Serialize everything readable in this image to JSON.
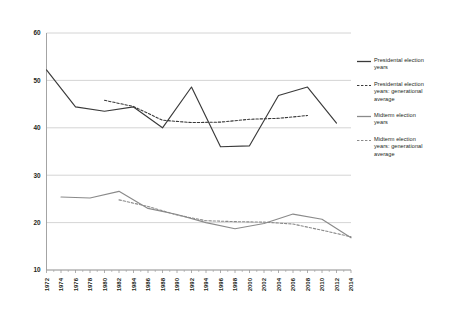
{
  "chart_data": {
    "type": "line",
    "title": "",
    "xlabel": "",
    "ylabel": "",
    "xlim": [
      1972,
      2014
    ],
    "ylim": [
      10,
      60
    ],
    "ytick_values": [
      10,
      20,
      30,
      40,
      50,
      60
    ],
    "ytick_labels": [
      "10",
      "20",
      "30",
      "40",
      "50",
      "60"
    ],
    "grid": true,
    "grid_axis": "y",
    "legend_position": "right",
    "xtick_labels": [
      "1972",
      "1974",
      "1976",
      "1978",
      "1980",
      "1982",
      "1984",
      "1986",
      "1988",
      "1990",
      "1992",
      "1994",
      "1996",
      "1998",
      "2000",
      "2002",
      "2004",
      "2006",
      "2008",
      "2010",
      "2012",
      "2014"
    ],
    "xtick_values": [
      1972,
      1974,
      1976,
      1978,
      1980,
      1982,
      1984,
      1986,
      1988,
      1990,
      1992,
      1994,
      1996,
      1998,
      2000,
      2002,
      2004,
      2006,
      2008,
      2010,
      2012,
      2014
    ],
    "series": [
      {
        "name": "Presidental election years",
        "style": "solid",
        "color": "#3a3a3a",
        "x": [
          1972,
          1976,
          1980,
          1984,
          1988,
          1992,
          1996,
          2000,
          2004,
          2008,
          2012
        ],
        "values": [
          52.2,
          44.4,
          43.5,
          44.4,
          40.0,
          48.6,
          36.0,
          36.2,
          46.8,
          48.6,
          41.0
        ]
      },
      {
        "name": "Presidental election years: generational average",
        "style": "dashed",
        "color": "#3a3a3a",
        "x": [
          1980,
          1984,
          1988,
          1992,
          1996,
          2000,
          2004,
          2008
        ],
        "values": [
          45.8,
          44.5,
          41.6,
          41.1,
          41.2,
          41.8,
          42.0,
          42.6
        ]
      },
      {
        "name": "Midterm election years",
        "style": "solid",
        "color": "#8a8a8a",
        "x": [
          1974,
          1978,
          1982,
          1986,
          1990,
          1994,
          1998,
          2002,
          2006,
          2010,
          2014
        ],
        "values": [
          25.4,
          25.2,
          26.6,
          23.0,
          21.7,
          20.0,
          18.7,
          19.8,
          21.8,
          20.7,
          16.8
        ]
      },
      {
        "name": "Midterm election years: generational average",
        "style": "dashed",
        "color": "#8a8a8a",
        "x": [
          1982,
          1986,
          1990,
          1994,
          1998,
          2002,
          2006,
          2010,
          2014
        ],
        "values": [
          24.8,
          23.4,
          21.6,
          20.4,
          20.2,
          20.1,
          19.7,
          18.4,
          17.0
        ]
      }
    ]
  },
  "legend": {
    "items": [
      {
        "label": "Presidental election\nyears",
        "style": "solid",
        "color": "#3a3a3a"
      },
      {
        "label": "Presidental election\nyears: generational\naverage",
        "style": "dashed",
        "color": "#3a3a3a"
      },
      {
        "label": "Midterm election\nyears",
        "style": "solid",
        "color": "#8a8a8a"
      },
      {
        "label": "Midterm election\nyears: generational\naverage",
        "style": "dashed",
        "color": "#8a8a8a"
      }
    ]
  },
  "colors": {
    "background": "#ffffff",
    "grid": "#c9c9c9",
    "axis": "#9a9a9a",
    "text": "#231f20",
    "presidential": "#3a3a3a",
    "midterm": "#8a8a8a"
  }
}
